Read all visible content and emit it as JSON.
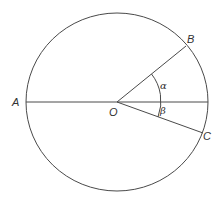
{
  "diagram": {
    "type": "circle-geometry",
    "center": {
      "label": "O",
      "x": 117,
      "y": 102
    },
    "circle": {
      "rx": 91,
      "ry": 89
    },
    "points": [
      {
        "label": "A",
        "x": 26,
        "y": 102
      },
      {
        "label": "B",
        "x": 186,
        "y": 46
      },
      {
        "label": "C",
        "x": 203,
        "y": 133
      }
    ],
    "angles": [
      {
        "label": "α",
        "between": [
          "OB",
          "OA-extension"
        ]
      },
      {
        "label": "β",
        "between": [
          "OA-extension",
          "OC"
        ]
      }
    ],
    "colors": {
      "stroke": "#4a4a4a",
      "text": "#333333"
    }
  }
}
